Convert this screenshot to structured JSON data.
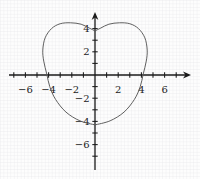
{
  "figure": {
    "background": "#fdfdfd",
    "grid_color": "#e3e3e6",
    "axis_color": "#1a1a1a",
    "tick_color": "#1a1a1a",
    "label_color": "#222222",
    "curve_color": "#565656"
  },
  "chart_data": {
    "type": "line",
    "title": "",
    "xlabel": "",
    "ylabel": "",
    "xlim": [
      -7.4,
      8.2
    ],
    "ylim": [
      -8.1,
      5.4
    ],
    "grid": true,
    "x_ticks": [
      -7,
      -6,
      -5,
      -4,
      -3,
      -2,
      -1,
      1,
      2,
      3,
      4,
      5,
      6,
      7
    ],
    "y_ticks": [
      -7,
      -6,
      -5,
      -4,
      -3,
      -2,
      -1,
      1,
      2,
      3,
      4
    ],
    "x_tick_labels": [
      {
        "value": -6,
        "label": "−6"
      },
      {
        "value": -4,
        "label": "−4"
      },
      {
        "value": -2,
        "label": "−2"
      },
      {
        "value": 2,
        "label": "2"
      },
      {
        "value": 4,
        "label": "4"
      },
      {
        "value": 6,
        "label": "6"
      }
    ],
    "y_tick_labels": [
      {
        "value": 4,
        "label": "4"
      },
      {
        "value": 2,
        "label": "2"
      },
      {
        "value": -2,
        "label": "−2"
      },
      {
        "value": -4,
        "label": "−4"
      },
      {
        "value": -6,
        "label": "−6"
      }
    ],
    "series": [
      {
        "name": "heart-curve-left-half",
        "points": [
          [
            0,
            -4.3
          ],
          [
            -1.3,
            -3.95
          ],
          [
            -2.5,
            -3.2
          ],
          [
            -3.4,
            -2.1
          ],
          [
            -3.9,
            -1.0
          ],
          [
            -4.15,
            0.05
          ],
          [
            -4.42,
            1.2
          ],
          [
            -4.5,
            2.15
          ],
          [
            -4.3,
            3.2
          ],
          [
            -3.75,
            4.0
          ],
          [
            -3.0,
            4.42
          ],
          [
            -2.1,
            4.5
          ],
          [
            -1.2,
            4.38
          ],
          [
            -0.5,
            4.05
          ],
          [
            0,
            3.8
          ]
        ]
      },
      {
        "name": "heart-curve-right-half",
        "points": [
          [
            0,
            -4.3
          ],
          [
            1.3,
            -3.95
          ],
          [
            2.5,
            -3.2
          ],
          [
            3.4,
            -2.1
          ],
          [
            3.9,
            -1.0
          ],
          [
            4.15,
            0.05
          ],
          [
            4.42,
            1.2
          ],
          [
            4.5,
            2.15
          ],
          [
            4.3,
            3.2
          ],
          [
            3.75,
            4.0
          ],
          [
            3.0,
            4.42
          ],
          [
            2.1,
            4.5
          ],
          [
            1.2,
            4.38
          ],
          [
            0.5,
            4.05
          ],
          [
            0,
            3.8
          ]
        ]
      }
    ]
  }
}
